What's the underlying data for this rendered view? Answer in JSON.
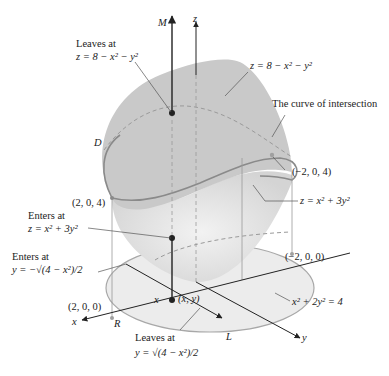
{
  "figure": {
    "colors": {
      "top_surface": "#c9c9c9",
      "bottom_surface": "#e2e2e2",
      "region_R": "#ececec",
      "curve": "#8a8a8a",
      "axis": "#222222",
      "guide": "#9a9a9a"
    },
    "axes": {
      "z": "z",
      "x": "x",
      "y": "y",
      "M": "M",
      "L": "L"
    },
    "labels": {
      "leaves_top_line1": "Leaves at",
      "leaves_top_line2": "z = 8 − x² − y²",
      "top_surface_eq": "z = 8 − x² − y²",
      "curve_of_intersection": "The curve of intersection",
      "D": "D",
      "point_neg2_0_4": "(−2, 0, 4)",
      "point_2_0_4": "(2, 0, 4)",
      "bottom_surface_eq": "z = x² + 3y²",
      "enters_z_line1": "Enters at",
      "enters_z_line2": "z = x² + 3y²",
      "enters_y_line1": "Enters at",
      "enters_y_line2": "y = −√(4 − x²)/2",
      "point_neg2_0_0": "(−2, 0, 0)",
      "point_2_0_0": "(2, 0, 0)",
      "ellipse_eq": "x² + 2y² = 4",
      "x_mark": "x",
      "xy_point": "(x, y)",
      "R": "R",
      "leaves_y_line1": "Leaves at",
      "leaves_y_line2": "y = √(4 − x²)/2"
    }
  }
}
